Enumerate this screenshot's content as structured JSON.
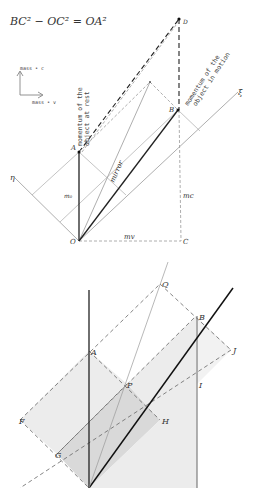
{
  "top_diagram": {
    "equation": "BC² − OC² = OA²",
    "legend": {
      "up_label": "mass • c",
      "right_label": "mass • v"
    },
    "axis_labels": {
      "eta": "η",
      "xi": "ξ"
    },
    "points": {
      "O": "O",
      "A": "A",
      "B": "B",
      "C": "C",
      "D": "D"
    },
    "segment_labels": {
      "m0": "m₀",
      "mc": "mc",
      "mv": "mv",
      "mirror": "mirror"
    },
    "annotations": {
      "rest_line1": "momentum of the",
      "rest_line2": "object at rest",
      "motion_line1": "momentum of the",
      "motion_line2": "object in motion"
    }
  },
  "bottom_diagram": {
    "points": {
      "A": "A",
      "B": "B",
      "Q": "Q",
      "P": "P",
      "J": "J",
      "I": "I",
      "H": "H",
      "G": "G",
      "F": "F"
    }
  },
  "colors": {
    "ink": "#222222",
    "light_line": "#999999",
    "shade_light": "#ececec",
    "shade_dark": "#d9d9d9"
  }
}
